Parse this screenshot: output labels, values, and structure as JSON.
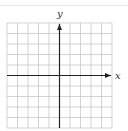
{
  "diagram": {
    "type": "coordinate-grid",
    "x_axis_label": "x",
    "y_axis_label": "y",
    "grid": {
      "columns": 10,
      "rows": 10,
      "left": 7,
      "top": 23,
      "cell_size": 10.5,
      "y_axis_column_index": 5,
      "x_axis_row_index": 5
    },
    "colors": {
      "grid_line": "#c8c8c8",
      "axis": "#222222",
      "top_rule": "#e4e4e4",
      "background": "#ffffff"
    }
  }
}
